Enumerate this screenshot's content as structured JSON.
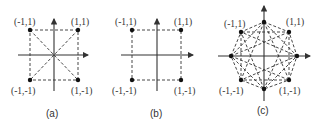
{
  "figure": {
    "panels": [
      {
        "id": "a",
        "caption": "(a)",
        "description": "QPSK-like square constellation with dashed square and diagonals",
        "points": [
          {
            "label": "(-1,1)",
            "x": -1,
            "y": 1
          },
          {
            "label": "(1,1)",
            "x": 1,
            "y": 1
          },
          {
            "label": "(-1,-1)",
            "x": -1,
            "y": -1
          },
          {
            "label": "(1,-1)",
            "x": 1,
            "y": -1
          }
        ],
        "connections": "square edges and both diagonals"
      },
      {
        "id": "b",
        "caption": "(b)",
        "description": "Square constellation with dashed square edges only",
        "points": [
          {
            "label": "(-1,1)",
            "x": -1,
            "y": 1
          },
          {
            "label": "(1,1)",
            "x": 1,
            "y": 1
          },
          {
            "label": "(-1,-1)",
            "x": -1,
            "y": -1
          },
          {
            "label": "(1,-1)",
            "x": 1,
            "y": -1
          }
        ],
        "connections": "square edges"
      },
      {
        "id": "c",
        "caption": "(c)",
        "description": "Eight-point octagon constellation with dashed star connections",
        "points": [
          {
            "label": "(-1,1)",
            "x": -1,
            "y": 1
          },
          {
            "label": "(1,1)",
            "x": 1,
            "y": 1
          },
          {
            "label": "(-1,-1)",
            "x": -1,
            "y": -1
          },
          {
            "label": "(1,-1)",
            "x": 1,
            "y": -1
          },
          {
            "label": "",
            "pos": "top"
          },
          {
            "label": "",
            "pos": "bottom"
          },
          {
            "label": "",
            "pos": "left"
          },
          {
            "label": "",
            "pos": "right"
          }
        ],
        "connections": "octagon edges plus chords to points two and three steps away"
      }
    ],
    "labels": {
      "a_tl": "(-1,1)",
      "a_tr": "(1,1)",
      "a_bl": "(-1,-1)",
      "a_br": "(1,-1)",
      "b_tl": "(-1,1)",
      "b_tr": "(1,1)",
      "b_bl": "(-1,-1)",
      "b_br": "(1,-1)",
      "c_tl": "(-1,1)",
      "c_tr": "(1,1)",
      "c_bl": "(-1,-1)",
      "c_br": "(1,-1)",
      "cap_a": "(a)",
      "cap_b": "(b)",
      "cap_c": "(c)"
    },
    "colors": {
      "ink": "#333333",
      "point": "#111111",
      "background": "#ffffff"
    }
  }
}
